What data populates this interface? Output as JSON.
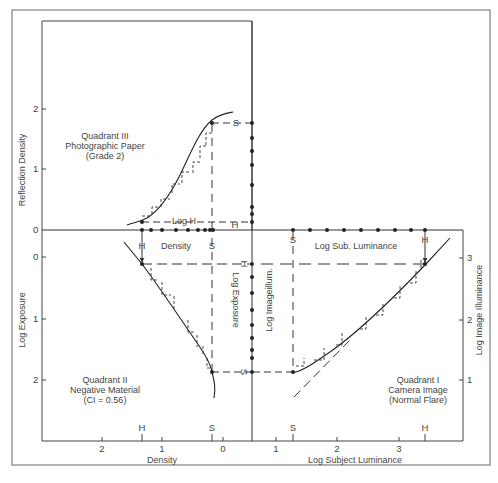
{
  "figure": {
    "caption": ""
  },
  "quadrants": {
    "q1": {
      "label_lines": [
        "Quadrant I",
        "Camera Image",
        "(Normal Flare)"
      ]
    },
    "q2": {
      "label_lines": [
        "Quadrant II",
        "Negative Material",
        "(CI = 0.56)"
      ]
    },
    "q3": {
      "label_lines": [
        "Quadrant III",
        "Photographic Paper",
        "(Grade 2)"
      ]
    }
  },
  "axes": {
    "left_top": {
      "label": "Reflection Density",
      "ticks": [
        "2",
        "1",
        "0"
      ]
    },
    "left_bottom": {
      "label": "Log Exposure",
      "ticks": [
        "0",
        "1",
        "2"
      ]
    },
    "right": {
      "label": "Log Image Illuminance",
      "ticks": [
        "3",
        "2",
        "1"
      ]
    },
    "bottom_left": {
      "label": "Density",
      "ticks": [
        "2",
        "1",
        "0"
      ],
      "markers": [
        "H",
        "S"
      ]
    },
    "bottom_right": {
      "label": "Log Subject Luminance",
      "ticks": [
        "1",
        "2",
        "3"
      ],
      "markers": [
        "S",
        "H"
      ]
    }
  },
  "inner_labels": {
    "log_h": "Log H",
    "density": "Density",
    "log_sub_luminance": "Log Sub. Luminance",
    "log_exposure": "Log Exposure",
    "log_image_illum": "Log Imageillum.",
    "h": "H",
    "s": "S"
  },
  "colors": {
    "line": "#333333",
    "frame": "#555555",
    "text": "#444444"
  }
}
